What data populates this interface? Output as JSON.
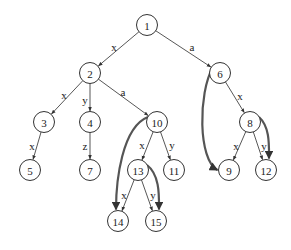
{
  "diagram": {
    "type": "trie / suffix-link tree",
    "nodes": [
      {
        "id": "1",
        "label": "1",
        "x": 147,
        "y": 25
      },
      {
        "id": "2",
        "label": "2",
        "x": 90,
        "y": 73
      },
      {
        "id": "6",
        "label": "6",
        "x": 220,
        "y": 73
      },
      {
        "id": "3",
        "label": "3",
        "x": 44,
        "y": 122
      },
      {
        "id": "4",
        "label": "4",
        "x": 90,
        "y": 122
      },
      {
        "id": "10",
        "label": "10",
        "x": 157,
        "y": 122
      },
      {
        "id": "8",
        "label": "8",
        "x": 250,
        "y": 122
      },
      {
        "id": "5",
        "label": "5",
        "x": 30,
        "y": 170
      },
      {
        "id": "7",
        "label": "7",
        "x": 90,
        "y": 170
      },
      {
        "id": "13",
        "label": "13",
        "x": 138,
        "y": 170
      },
      {
        "id": "11",
        "label": "11",
        "x": 174,
        "y": 170
      },
      {
        "id": "9",
        "label": "9",
        "x": 229,
        "y": 170
      },
      {
        "id": "12",
        "label": "12",
        "x": 266,
        "y": 170
      },
      {
        "id": "14",
        "label": "14",
        "x": 118,
        "y": 221
      },
      {
        "id": "15",
        "label": "15",
        "x": 156,
        "y": 221
      }
    ],
    "edges": [
      {
        "from": "1",
        "to": "2",
        "label": "x",
        "lx": 114,
        "ly": 47
      },
      {
        "from": "1",
        "to": "6",
        "label": "a",
        "lx": 192,
        "ly": 47
      },
      {
        "from": "2",
        "to": "3",
        "label": "x",
        "lx": 64,
        "ly": 95
      },
      {
        "from": "2",
        "to": "4",
        "label": "y",
        "lx": 85,
        "ly": 100
      },
      {
        "from": "2",
        "to": "10",
        "label": "a",
        "lx": 123,
        "ly": 92
      },
      {
        "from": "6",
        "to": "8",
        "label": "x",
        "lx": 240,
        "ly": 96
      },
      {
        "from": "3",
        "to": "5",
        "label": "x",
        "lx": 32,
        "ly": 146
      },
      {
        "from": "4",
        "to": "7",
        "label": "z",
        "lx": 85,
        "ly": 146
      },
      {
        "from": "10",
        "to": "13",
        "label": "x",
        "lx": 142,
        "ly": 145
      },
      {
        "from": "10",
        "to": "11",
        "label": "y",
        "lx": 172,
        "ly": 145
      },
      {
        "from": "8",
        "to": "9",
        "label": "x",
        "lx": 236,
        "ly": 146
      },
      {
        "from": "8",
        "to": "12",
        "label": "y",
        "lx": 264,
        "ly": 146
      },
      {
        "from": "13",
        "to": "14",
        "label": "x",
        "lx": 124,
        "ly": 195
      },
      {
        "from": "13",
        "to": "15",
        "label": "y",
        "lx": 153,
        "ly": 195
      }
    ],
    "links": [
      {
        "from": "6",
        "to": "9"
      },
      {
        "from": "8",
        "to": "12"
      },
      {
        "from": "10",
        "to": "14"
      },
      {
        "from": "13",
        "to": "15"
      }
    ],
    "colors": {
      "edge": "#444444",
      "link": "#555555",
      "node_stroke": "#333333",
      "background": "#ffffff"
    }
  }
}
